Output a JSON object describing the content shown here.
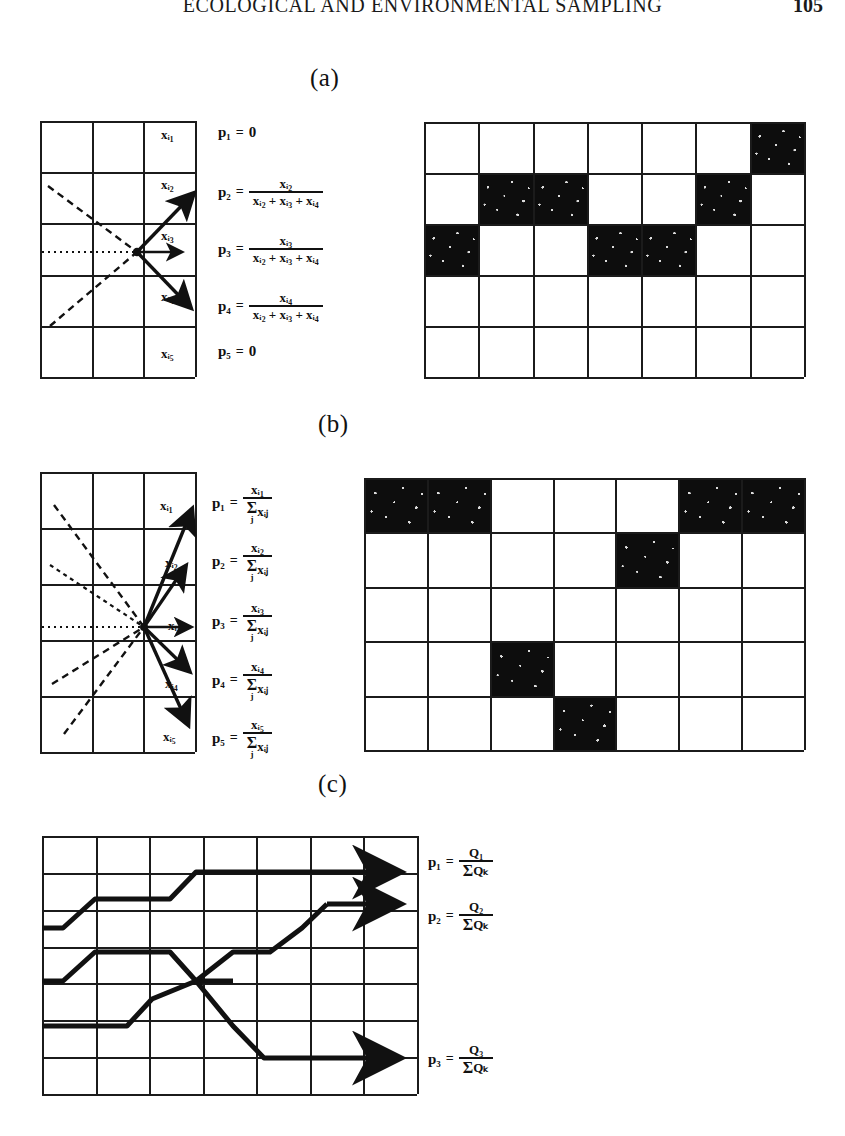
{
  "header": {
    "running_head": "ECOLOGICAL AND ENVIRONMENTAL SAMPLING",
    "page_number": "105"
  },
  "panels": [
    {
      "id": "a",
      "label": "(a)",
      "cell_labels": [
        "xᵢ₁",
        "xᵢ₂",
        "xᵢ₃",
        "xᵢ₄",
        "xᵢ₅"
      ],
      "formulas": [
        {
          "p": "p₁",
          "eq": "=",
          "kind": "zero",
          "value": "0"
        },
        {
          "p": "p₂",
          "eq": "=",
          "kind": "fraction",
          "numerator": "xᵢ₂",
          "denominator": "xᵢ₂ + xᵢ₃ + xᵢ₄"
        },
        {
          "p": "p₃",
          "eq": "=",
          "kind": "fraction",
          "numerator": "xᵢ₃",
          "denominator": "xᵢ₂ + xᵢ₃ + xᵢ₄"
        },
        {
          "p": "p₄",
          "eq": "=",
          "kind": "fraction",
          "numerator": "xᵢ₄",
          "denominator": "xᵢ₂ + xᵢ₃ + xᵢ₄"
        },
        {
          "p": "p₅",
          "eq": "=",
          "kind": "zero",
          "value": "0"
        }
      ],
      "right_grid": {
        "rows": 5,
        "cols": 7,
        "filled_cells": [
          [
            1,
            7
          ],
          [
            2,
            2
          ],
          [
            2,
            3
          ],
          [
            2,
            6
          ],
          [
            3,
            1
          ],
          [
            3,
            4
          ],
          [
            3,
            5
          ]
        ]
      }
    },
    {
      "id": "b",
      "label": "(b)",
      "cell_labels": [
        "xᵢ₁",
        "xᵢ₂",
        "xᵢ₃",
        "xᵢ₄",
        "xᵢ₅"
      ],
      "formulas": [
        {
          "p": "p₁",
          "eq": "=",
          "kind": "sum_fraction",
          "numerator": "xᵢ₁",
          "sum_symbol": "Σ",
          "sum_index": "j",
          "sum_term": "xᵢⱼ"
        },
        {
          "p": "p₂",
          "eq": "=",
          "kind": "sum_fraction",
          "numerator": "xᵢ₂",
          "sum_symbol": "Σ",
          "sum_index": "j",
          "sum_term": "xᵢⱼ"
        },
        {
          "p": "p₃",
          "eq": "=",
          "kind": "sum_fraction",
          "numerator": "xᵢ₃",
          "sum_symbol": "Σ",
          "sum_index": "j",
          "sum_term": "xᵢⱼ"
        },
        {
          "p": "p₄",
          "eq": "=",
          "kind": "sum_fraction",
          "numerator": "xᵢ₄",
          "sum_symbol": "Σ",
          "sum_index": "j",
          "sum_term": "xᵢⱼ"
        },
        {
          "p": "p₅",
          "eq": "=",
          "kind": "sum_fraction",
          "numerator": "xᵢ₅",
          "sum_symbol": "Σ",
          "sum_index": "j",
          "sum_term": "xᵢⱼ"
        }
      ],
      "right_grid": {
        "rows": 5,
        "cols": 7,
        "filled_cells": [
          [
            1,
            1
          ],
          [
            1,
            2
          ],
          [
            1,
            6
          ],
          [
            1,
            7
          ],
          [
            2,
            5
          ],
          [
            4,
            3
          ],
          [
            5,
            4
          ]
        ]
      }
    },
    {
      "id": "c",
      "label": "(c)",
      "formulas": [
        {
          "p": "p₁",
          "eq": "=",
          "kind": "sum_fraction",
          "numerator": "Q₁",
          "sum_symbol": "Σ",
          "sum_index": "",
          "sum_term": "Qₖ"
        },
        {
          "p": "p₂",
          "eq": "=",
          "kind": "sum_fraction",
          "numerator": "Q₂",
          "sum_symbol": "Σ",
          "sum_index": "",
          "sum_term": "Qₖ"
        },
        {
          "p": "p₃",
          "eq": "=",
          "kind": "sum_fraction",
          "numerator": "Q₃",
          "sum_symbol": "Σ",
          "sum_index": "",
          "sum_term": "Qₖ"
        }
      ],
      "grid": {
        "rows": 7,
        "cols": 7
      }
    }
  ],
  "colors": {
    "ink": "#111111",
    "fill": "#0d0d0d",
    "paper": "#ffffff"
  }
}
